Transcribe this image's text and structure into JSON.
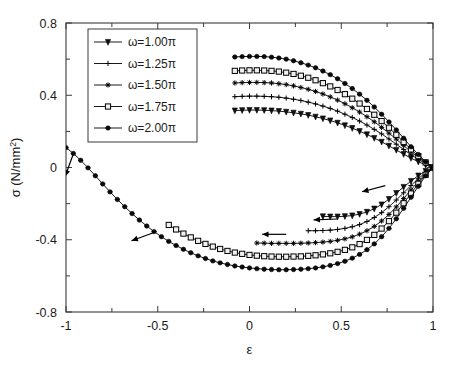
{
  "chart_data": {
    "type": "line",
    "title": "",
    "xlabel": "ε",
    "ylabel_main": "σ",
    "ylabel_units_open": "(N/mm",
    "ylabel_units_sup": "2",
    "ylabel_units_close": ")",
    "xlim": [
      -1,
      1
    ],
    "ylim": [
      -0.8,
      0.8
    ],
    "xticks": [
      "-1",
      "-0.5",
      "0",
      "0.5",
      "1"
    ],
    "xtick_values": [
      -1,
      -0.5,
      0,
      0.5,
      1
    ],
    "yticks": [
      "0.8",
      "0.4",
      "0",
      "-0.4",
      "-0.8"
    ],
    "ytick_values": [
      0.8,
      0.4,
      0,
      -0.4,
      -0.8
    ],
    "grid": false,
    "legend_position": "upper-left-inside",
    "marker_colors": "#000000",
    "line_color": "#000000",
    "series": [
      {
        "name": "ω=1.00π",
        "marker": "down-triangle",
        "upper_branch": {
          "x": [
            -0.08,
            -0.04,
            0.0,
            0.04,
            0.08,
            0.12,
            0.16,
            0.2,
            0.24,
            0.28,
            0.32,
            0.36,
            0.4,
            0.44,
            0.48,
            0.52,
            0.56,
            0.6,
            0.64,
            0.68,
            0.72,
            0.76,
            0.8,
            0.84,
            0.88,
            0.92,
            0.96,
            1.0
          ],
          "y": [
            0.315,
            0.317,
            0.318,
            0.318,
            0.317,
            0.315,
            0.312,
            0.308,
            0.303,
            0.297,
            0.29,
            0.281,
            0.271,
            0.26,
            0.247,
            0.233,
            0.218,
            0.201,
            0.183,
            0.163,
            0.142,
            0.12,
            0.097,
            0.074,
            0.052,
            0.032,
            0.014,
            0.0
          ]
        },
        "lower_branch": {
          "x": [
            1.0,
            0.96,
            0.92,
            0.88,
            0.84,
            0.8,
            0.76,
            0.72,
            0.68,
            0.64,
            0.6,
            0.56,
            0.52,
            0.48,
            0.44,
            0.4
          ],
          "y": [
            0.0,
            -0.02,
            -0.045,
            -0.075,
            -0.108,
            -0.142,
            -0.175,
            -0.205,
            -0.228,
            -0.246,
            -0.258,
            -0.266,
            -0.27,
            -0.272,
            -0.272,
            -0.271
          ]
        }
      },
      {
        "name": "ω=1.25π",
        "marker": "plus",
        "upper_branch": {
          "x": [
            -0.08,
            -0.04,
            0.0,
            0.04,
            0.08,
            0.12,
            0.16,
            0.2,
            0.24,
            0.28,
            0.32,
            0.36,
            0.4,
            0.44,
            0.48,
            0.52,
            0.56,
            0.6,
            0.64,
            0.68,
            0.72,
            0.76,
            0.8,
            0.84,
            0.88,
            0.92,
            0.96,
            1.0
          ],
          "y": [
            0.392,
            0.394,
            0.395,
            0.395,
            0.394,
            0.392,
            0.389,
            0.384,
            0.378,
            0.371,
            0.362,
            0.352,
            0.34,
            0.327,
            0.312,
            0.295,
            0.277,
            0.257,
            0.235,
            0.211,
            0.186,
            0.158,
            0.129,
            0.1,
            0.071,
            0.045,
            0.02,
            0.0
          ]
        },
        "lower_branch": {
          "x": [
            1.0,
            0.96,
            0.92,
            0.88,
            0.84,
            0.8,
            0.76,
            0.72,
            0.68,
            0.64,
            0.6,
            0.56,
            0.52,
            0.48,
            0.44,
            0.4,
            0.36,
            0.32
          ],
          "y": [
            0.0,
            -0.028,
            -0.062,
            -0.1,
            -0.14,
            -0.18,
            -0.217,
            -0.25,
            -0.277,
            -0.299,
            -0.316,
            -0.328,
            -0.337,
            -0.343,
            -0.347,
            -0.349,
            -0.35,
            -0.35
          ]
        }
      },
      {
        "name": "ω=1.50π",
        "marker": "star",
        "upper_branch": {
          "x": [
            -0.08,
            -0.04,
            0.0,
            0.04,
            0.08,
            0.12,
            0.16,
            0.2,
            0.24,
            0.28,
            0.32,
            0.36,
            0.4,
            0.44,
            0.48,
            0.52,
            0.56,
            0.6,
            0.64,
            0.68,
            0.72,
            0.76,
            0.8,
            0.84,
            0.88,
            0.92,
            0.96,
            1.0
          ],
          "y": [
            0.468,
            0.47,
            0.471,
            0.471,
            0.47,
            0.468,
            0.464,
            0.459,
            0.452,
            0.443,
            0.433,
            0.421,
            0.407,
            0.391,
            0.373,
            0.353,
            0.331,
            0.307,
            0.281,
            0.253,
            0.222,
            0.19,
            0.157,
            0.122,
            0.087,
            0.055,
            0.025,
            0.0
          ]
        },
        "lower_branch": {
          "x": [
            1.0,
            0.96,
            0.92,
            0.88,
            0.84,
            0.8,
            0.76,
            0.72,
            0.68,
            0.64,
            0.6,
            0.56,
            0.52,
            0.48,
            0.44,
            0.4,
            0.36,
            0.32,
            0.28,
            0.24,
            0.2,
            0.16,
            0.12,
            0.08,
            0.04
          ],
          "y": [
            0.0,
            -0.035,
            -0.078,
            -0.124,
            -0.172,
            -0.218,
            -0.26,
            -0.296,
            -0.326,
            -0.35,
            -0.369,
            -0.384,
            -0.395,
            -0.403,
            -0.409,
            -0.413,
            -0.416,
            -0.418,
            -0.419,
            -0.42,
            -0.42,
            -0.42,
            -0.42,
            -0.419,
            -0.418
          ]
        }
      },
      {
        "name": "ω=1.75π",
        "marker": "square",
        "upper_branch": {
          "x": [
            -0.08,
            -0.04,
            0.0,
            0.04,
            0.08,
            0.12,
            0.16,
            0.2,
            0.24,
            0.28,
            0.32,
            0.36,
            0.4,
            0.44,
            0.48,
            0.52,
            0.56,
            0.6,
            0.64,
            0.68,
            0.72,
            0.76,
            0.8,
            0.84,
            0.88,
            0.92,
            0.96,
            1.0
          ],
          "y": [
            0.535,
            0.537,
            0.538,
            0.538,
            0.537,
            0.535,
            0.531,
            0.525,
            0.518,
            0.508,
            0.497,
            0.483,
            0.467,
            0.449,
            0.429,
            0.406,
            0.381,
            0.354,
            0.324,
            0.292,
            0.257,
            0.22,
            0.181,
            0.141,
            0.1,
            0.063,
            0.028,
            0.0
          ]
        },
        "lower_branch": {
          "x": [
            1.0,
            0.96,
            0.92,
            0.88,
            0.84,
            0.8,
            0.76,
            0.72,
            0.68,
            0.64,
            0.6,
            0.56,
            0.52,
            0.48,
            0.44,
            0.4,
            0.36,
            0.32,
            0.28,
            0.24,
            0.2,
            0.16,
            0.12,
            0.08,
            0.04,
            0.0,
            -0.04,
            -0.08,
            -0.12,
            -0.16,
            -0.2,
            -0.24,
            -0.28,
            -0.32,
            -0.36,
            -0.4,
            -0.44
          ],
          "y": [
            0.0,
            -0.04,
            -0.09,
            -0.144,
            -0.198,
            -0.25,
            -0.297,
            -0.338,
            -0.373,
            -0.401,
            -0.424,
            -0.442,
            -0.456,
            -0.467,
            -0.475,
            -0.481,
            -0.486,
            -0.489,
            -0.492,
            -0.493,
            -0.494,
            -0.494,
            -0.493,
            -0.491,
            -0.488,
            -0.484,
            -0.478,
            -0.471,
            -0.462,
            -0.451,
            -0.438,
            -0.423,
            -0.406,
            -0.387,
            -0.366,
            -0.343,
            -0.318
          ]
        }
      },
      {
        "name": "ω=2.00π",
        "marker": "hexagram",
        "upper_branch": {
          "x": [
            -0.08,
            -0.04,
            0.0,
            0.04,
            0.08,
            0.12,
            0.16,
            0.2,
            0.24,
            0.28,
            0.32,
            0.36,
            0.4,
            0.44,
            0.48,
            0.52,
            0.56,
            0.6,
            0.64,
            0.68,
            0.72,
            0.76,
            0.8,
            0.84,
            0.88,
            0.92,
            0.96,
            1.0
          ],
          "y": [
            0.612,
            0.614,
            0.615,
            0.615,
            0.614,
            0.611,
            0.606,
            0.6,
            0.591,
            0.58,
            0.567,
            0.552,
            0.534,
            0.514,
            0.491,
            0.465,
            0.437,
            0.406,
            0.372,
            0.335,
            0.295,
            0.252,
            0.208,
            0.162,
            0.115,
            0.072,
            0.032,
            0.0
          ]
        },
        "lower_branch": {
          "x": [
            1.0,
            0.96,
            0.92,
            0.88,
            0.84,
            0.8,
            0.76,
            0.72,
            0.68,
            0.64,
            0.6,
            0.56,
            0.52,
            0.48,
            0.44,
            0.4,
            0.36,
            0.32,
            0.28,
            0.24,
            0.2,
            0.16,
            0.12,
            0.08,
            0.04,
            0.0,
            -0.04,
            -0.08,
            -0.12,
            -0.16,
            -0.2,
            -0.24,
            -0.28,
            -0.32,
            -0.36,
            -0.4,
            -0.44,
            -0.48,
            -0.52,
            -0.56,
            -0.6,
            -0.64,
            -0.68,
            -0.72,
            -0.76,
            -0.8,
            -0.84,
            -0.88,
            -0.92,
            -0.96,
            -1.0
          ],
          "y": [
            0.0,
            -0.046,
            -0.104,
            -0.165,
            -0.226,
            -0.284,
            -0.337,
            -0.383,
            -0.423,
            -0.455,
            -0.481,
            -0.502,
            -0.519,
            -0.532,
            -0.542,
            -0.55,
            -0.556,
            -0.56,
            -0.563,
            -0.565,
            -0.566,
            -0.566,
            -0.565,
            -0.563,
            -0.56,
            -0.556,
            -0.551,
            -0.545,
            -0.537,
            -0.528,
            -0.517,
            -0.504,
            -0.489,
            -0.472,
            -0.453,
            -0.432,
            -0.409,
            -0.383,
            -0.355,
            -0.324,
            -0.291,
            -0.255,
            -0.217,
            -0.177,
            -0.135,
            -0.091,
            -0.046,
            -0.002,
            0.04,
            0.078,
            0.11
          ]
        }
      }
    ],
    "arrows": [
      {
        "x": 0.74,
        "y": -0.1,
        "angle": 195,
        "note": "upper-right cluster inward"
      },
      {
        "x": 0.48,
        "y": -0.285,
        "angle": 182,
        "note": "1.25pi lower branch"
      },
      {
        "x": 0.2,
        "y": -0.37,
        "angle": 180,
        "note": "1.50pi lower branch"
      },
      {
        "x": -0.52,
        "y": -0.36,
        "angle": 200,
        "note": "1.75pi lower branch"
      },
      {
        "x": -0.96,
        "y": 0.075,
        "angle": 250,
        "note": "2.00pi lower branch end"
      }
    ]
  },
  "legend": {
    "entries": [
      {
        "label": "ω=1.00π"
      },
      {
        "label": "ω=1.25π"
      },
      {
        "label": "ω=1.50π"
      },
      {
        "label": "ω=1.75π"
      },
      {
        "label": "ω=2.00π"
      }
    ]
  }
}
